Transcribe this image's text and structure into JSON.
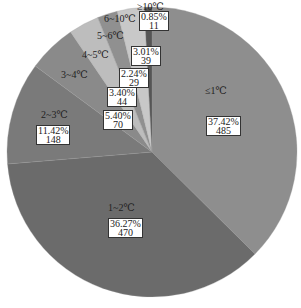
{
  "chart_data": {
    "type": "pie",
    "title": "",
    "start_angle_deg": 0,
    "direction": "clockwise",
    "categories": [
      "≤1℃",
      "1~2℃",
      "2~3℃",
      "3~4℃",
      "4~5℃",
      "5~6℃",
      "6~10℃",
      "≥10℃"
    ],
    "values": [
      485,
      470,
      148,
      70,
      44,
      29,
      39,
      11
    ],
    "percentages": [
      "37.42%",
      "36.27%",
      "11.42%",
      "5.40%",
      "3.40%",
      "2.24%",
      "3.01%",
      "0.85%"
    ],
    "colors": [
      "#8e8e8e",
      "#6b6b6b",
      "#7a7a7a",
      "#8a8a8a",
      "#bdbdbd",
      "#909090",
      "#c8c8c8",
      "#555555"
    ],
    "legend": "none",
    "data_labels": "category name, percentage and count"
  },
  "labels": [
    {
      "name": "≤1℃",
      "pct": "37.42%",
      "count": "485"
    },
    {
      "name": "1~2℃",
      "pct": "36.27%",
      "count": "470"
    },
    {
      "name": "2~3℃",
      "pct": "11.42%",
      "count": "148"
    },
    {
      "name": "3~4℃",
      "pct": "5.40%",
      "count": "70"
    },
    {
      "name": "4~5℃",
      "pct": "3.40%",
      "count": "44"
    },
    {
      "name": "5~6℃",
      "pct": "2.24%",
      "count": "29"
    },
    {
      "name": "6~10℃",
      "pct": "3.01%",
      "count": "39"
    },
    {
      "name": "≥10℃",
      "pct": "0.85%",
      "count": "11"
    }
  ]
}
